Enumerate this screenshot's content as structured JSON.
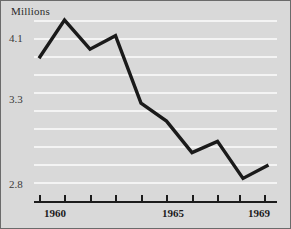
{
  "chart_data": {
    "type": "line",
    "title": "",
    "ylabel": "Millions",
    "xlabel": "",
    "x": [
      1960,
      1961,
      1962,
      1963,
      1964,
      1965,
      1966,
      1967,
      1968,
      1969
    ],
    "values": [
      3.92,
      4.26,
      4.0,
      4.12,
      3.52,
      3.36,
      3.08,
      3.18,
      2.85,
      2.97
    ],
    "series": [
      {
        "name": "Millions",
        "values": [
          3.92,
          4.26,
          4.0,
          4.12,
          3.52,
          3.36,
          3.08,
          3.18,
          2.85,
          2.97
        ]
      }
    ],
    "ylim": [
      2.72,
      4.33
    ],
    "xlim": [
      1959.6,
      1969.7
    ],
    "ytick_values": [
      4.1,
      3.3,
      2.8
    ],
    "ytick_labels": [
      "4.1",
      "3.3",
      "2.8"
    ],
    "xtick_values": [
      1960,
      1961,
      1962,
      1963,
      1964,
      1965,
      1966,
      1967,
      1968,
      1969
    ],
    "xtick_labels_shown": [
      {
        "value": 1960,
        "label": "1960"
      },
      {
        "value": 1965,
        "label": "1965"
      },
      {
        "value": 1969,
        "label": "1969"
      }
    ],
    "gridlines": {
      "axis": "y",
      "visible": true,
      "count": 10,
      "color": "#f4f4f4"
    },
    "legend": {
      "visible": false,
      "position": "none"
    },
    "colors": {
      "background": "#d9d9d9",
      "line": "#1a1a1a",
      "grid": "#f4f4f4",
      "axis": "#1c1c1c",
      "text": "#2b2b2b",
      "border": "#6b6b6b"
    },
    "line_width": 3.4
  },
  "geometry": {
    "plot_left": 33,
    "plot_right": 276,
    "axis_y": 200,
    "gridline_ys": [
      37,
      55,
      73,
      91,
      98,
      116,
      134,
      152,
      170,
      183
    ],
    "value_anchor_high": {
      "value": 4.1,
      "y": 37
    },
    "value_anchor_low": {
      "value": 2.8,
      "y": 183
    },
    "x_first": 38,
    "x_step": 25.5,
    "point_xs": [
      38,
      63.5,
      89,
      114.5,
      140,
      165.5,
      191,
      216.5,
      238,
      263
    ],
    "point_ys": [
      57,
      19,
      48,
      34,
      102,
      120,
      152,
      141,
      175,
      161
    ]
  }
}
